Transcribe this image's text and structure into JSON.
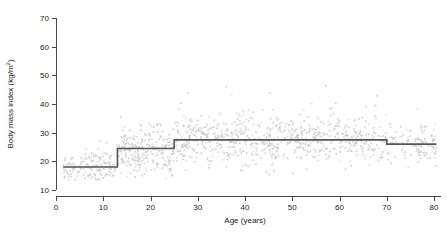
{
  "chart_data": {
    "type": "scatter",
    "title": "",
    "subtitle": "",
    "xlabel": "Age (years)",
    "ylabel": "Body mass index (kg/m²)",
    "ylabel_base": "Body mass index (kg/m",
    "ylabel_sup": "2",
    "ylabel_close": ")",
    "xlim": [
      0,
      80
    ],
    "ylim": [
      10,
      70
    ],
    "xticks": [
      0,
      10,
      20,
      30,
      40,
      50,
      60,
      70,
      80
    ],
    "xtick_labels": [
      "0",
      "10",
      "20",
      "30",
      "40",
      "50",
      "60",
      "70",
      "80"
    ],
    "yticks": [
      10,
      20,
      30,
      40,
      50,
      60,
      70
    ],
    "ytick_labels": [
      "10",
      "20",
      "30",
      "40",
      "50",
      "60",
      "70"
    ],
    "grid": false,
    "legend": null,
    "point_color": "#c9c9c9",
    "line_color": "#555555",
    "axis_color": "#4a4a4a",
    "series": [
      {
        "name": "Individual observations",
        "type": "scatter",
        "marker": "square",
        "marker_size": 1.6,
        "color": "#c9c9c9",
        "description": "Scatter of body mass index against age, roughly 1400 points, spread widening with age; values mostly 14-38 with outliers up to 55."
      },
      {
        "name": "Reference step function",
        "type": "step",
        "color": "#555555",
        "breakpoints": [
          0,
          13,
          25,
          70,
          80
        ],
        "levels": [
          18.0,
          24.5,
          27.5,
          26.0
        ],
        "step_points": [
          {
            "x": 1.5,
            "y": 18.0
          },
          {
            "x": 13.0,
            "y": 18.0
          },
          {
            "x": 13.0,
            "y": 24.5
          },
          {
            "x": 25.0,
            "y": 24.5
          },
          {
            "x": 25.0,
            "y": 27.5
          },
          {
            "x": 70.0,
            "y": 27.5
          },
          {
            "x": 70.0,
            "y": 26.0
          },
          {
            "x": 80.5,
            "y": 26.0
          }
        ]
      }
    ],
    "scatter_bands": [
      {
        "x_start": 1.5,
        "x_end": 13.0,
        "y_center": 17.5,
        "y_spread": 4.2,
        "density": 150,
        "y_max": 43.0,
        "y_min": 13.0
      },
      {
        "x_start": 13.0,
        "x_end": 25.0,
        "y_center": 23.0,
        "y_spread": 6.5,
        "density": 260,
        "y_max": 48.0,
        "y_min": 14.0
      },
      {
        "x_start": 25.0,
        "x_end": 50.0,
        "y_center": 27.0,
        "y_spread": 7.5,
        "density": 420,
        "y_max": 55.0,
        "y_min": 15.0
      },
      {
        "x_start": 50.0,
        "x_end": 70.0,
        "y_center": 27.5,
        "y_spread": 6.8,
        "density": 300,
        "y_max": 50.0,
        "y_min": 15.0
      },
      {
        "x_start": 70.0,
        "x_end": 80.5,
        "y_center": 26.0,
        "y_spread": 5.5,
        "density": 120,
        "y_max": 41.0,
        "y_min": 15.0
      }
    ]
  }
}
